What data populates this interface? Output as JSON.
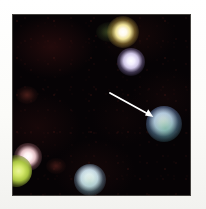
{
  "figure": {
    "kind": "astronomical-image-cutout",
    "width_px": 206,
    "height_px": 209,
    "caption": "",
    "background_color": "#060305",
    "margin_color": "#fdfdfb",
    "panel": {
      "x": 12,
      "y": 14,
      "width": 179,
      "height": 182
    }
  },
  "annotation": {
    "arrow": {
      "label": "target-arrow",
      "color": "#ffffff",
      "tail_x": 110,
      "tail_y": 93,
      "tip_x": 153,
      "tip_y": 117,
      "points_to": "target-source"
    }
  },
  "sources": [
    {
      "name": "source-top-yellow",
      "x": 123,
      "y": 30,
      "radius_px": 7,
      "core_color": "#fffdf0",
      "halo_color": "#c8b05a",
      "brightness": "bright"
    },
    {
      "name": "source-upper-lavender",
      "x": 131,
      "y": 61,
      "radius_px": 6,
      "core_color": "#f2eeff",
      "halo_color": "#6d5f8c",
      "brightness": "medium"
    },
    {
      "name": "target-source",
      "x": 162,
      "y": 122,
      "radius_px": 8,
      "core_color": "#eaf2ff",
      "halo_color": "#5f7ba8",
      "accent_color": "#4f8f72",
      "brightness": "bright"
    },
    {
      "name": "source-lower-left-pink",
      "x": 28,
      "y": 157,
      "radius_px": 6,
      "core_color": "#fff0f0",
      "halo_color": "#8c5a62",
      "brightness": "medium"
    },
    {
      "name": "source-left-edge-green",
      "x": 13,
      "y": 170,
      "radius_px": 7,
      "core_color": "#d8e86a",
      "halo_color": "#6b7a22",
      "brightness": "medium"
    },
    {
      "name": "source-bottom-white",
      "x": 91,
      "y": 180,
      "radius_px": 7,
      "core_color": "#f4fbff",
      "halo_color": "#5a6e84",
      "brightness": "bright"
    },
    {
      "name": "source-faint-green-smudge",
      "x": 108,
      "y": 34,
      "radius_px": 6,
      "core_color": "#3c4a26",
      "halo_color": "#23301a",
      "brightness": "faint"
    },
    {
      "name": "source-faint-red-left",
      "x": 24,
      "y": 96,
      "radius_px": 5,
      "core_color": "#50201c",
      "halo_color": "#2a1210",
      "brightness": "faint"
    },
    {
      "name": "source-faint-red-lower",
      "x": 55,
      "y": 168,
      "radius_px": 5,
      "core_color": "#4a1e1a",
      "halo_color": "#26100e",
      "brightness": "faint"
    }
  ]
}
